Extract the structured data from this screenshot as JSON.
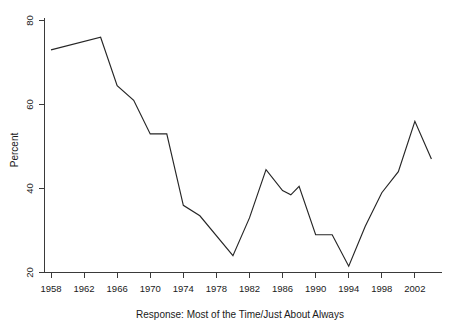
{
  "chart_data": {
    "type": "line",
    "title": "",
    "subtitle": "",
    "xlabel": "Response: Most of the Time/Just About Always",
    "ylabel": "Percent",
    "xlim": [
      1958,
      2004
    ],
    "ylim": [
      20,
      80
    ],
    "grid": false,
    "legend": null,
    "x_ticks": [
      1958,
      1962,
      1966,
      1970,
      1974,
      1978,
      1982,
      1986,
      1990,
      1994,
      1998,
      2002
    ],
    "y_ticks": [
      20,
      40,
      60,
      80
    ],
    "series": [
      {
        "name": "Trust in government: Most of the Time/Just About Always",
        "color": "#262626",
        "x": [
          1958,
          1964,
          1966,
          1968,
          1970,
          1972,
          1974,
          1976,
          1980,
          1982,
          1984,
          1986,
          1987,
          1988,
          1990,
          1992,
          1994,
          1996,
          1998,
          2000,
          2002,
          2004
        ],
        "values": [
          73.0,
          76.0,
          64.5,
          61.0,
          53.0,
          53.0,
          36.0,
          33.5,
          24.0,
          33.0,
          44.5,
          39.5,
          38.5,
          40.5,
          29.0,
          29.0,
          21.5,
          31.0,
          39.0,
          44.0,
          56.0,
          47.0
        ]
      }
    ]
  },
  "axes": {
    "y_axis_title": "Percent",
    "x_axis_title": "Response: Most of the Time/Just About Always",
    "y_tick_labels": [
      "20",
      "40",
      "60",
      "80"
    ],
    "x_tick_labels": [
      "1958",
      "1962",
      "1966",
      "1970",
      "1974",
      "1978",
      "1982",
      "1986",
      "1990",
      "1994",
      "1998",
      "2002"
    ]
  },
  "colors": {
    "line": "#262626",
    "axis": "#3a3a3a",
    "background": "#ffffff",
    "text": "#1a1a1a"
  }
}
